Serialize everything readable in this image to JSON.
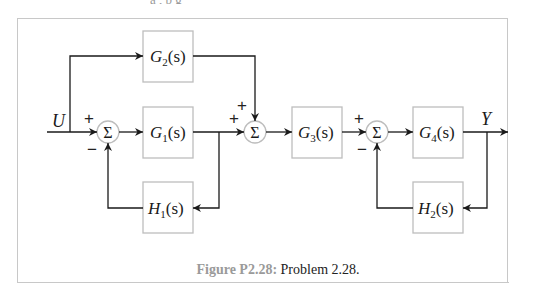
{
  "figure": {
    "caption_label": "Figure P2.28:",
    "caption_text": " Problem 2.28.",
    "top_cut_text": "a  ,   b        g"
  },
  "signals": {
    "input": "U",
    "output": "Y"
  },
  "blocks": {
    "G1": {
      "name": "G",
      "sub": "1",
      "arg": "(s)"
    },
    "G2": {
      "name": "G",
      "sub": "2",
      "arg": "(s)"
    },
    "G3": {
      "name": "G",
      "sub": "3",
      "arg": "(s)"
    },
    "G4": {
      "name": "G",
      "sub": "4",
      "arg": "(s)"
    },
    "H1": {
      "name": "H",
      "sub": "1",
      "arg": "(s)"
    },
    "H2": {
      "name": "H",
      "sub": "2",
      "arg": "(s)"
    }
  },
  "summers": {
    "symbol": "Σ",
    "sum1": {
      "top_sign": "+",
      "bottom_sign": "−"
    },
    "sum2": {
      "top_sign": "+",
      "left_sign": "+"
    },
    "sum3": {
      "top_sign": "+",
      "bottom_sign": "−"
    }
  },
  "colors": {
    "line": "#1a1a1a",
    "box_border": "#bdbdbd",
    "frame": "#c8c8c8",
    "caption_label": "#9a9a9a"
  }
}
